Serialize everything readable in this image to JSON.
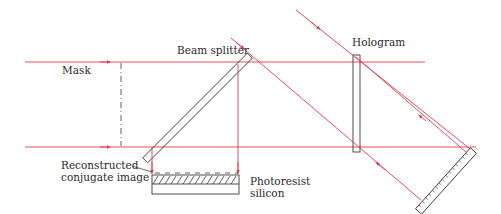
{
  "labels": {
    "mask": "Mask",
    "beam_splitter": "Beam splitter",
    "hologram": "Hologram",
    "reconstructed_line1": "Reconstructed",
    "reconstructed_line2": "conjugate image",
    "photoresist": "Photoresist",
    "silicon": "silicon"
  },
  "colors": {
    "beam": "#e23b4a",
    "component": "#3a3a3a",
    "background": "#ffffff"
  }
}
